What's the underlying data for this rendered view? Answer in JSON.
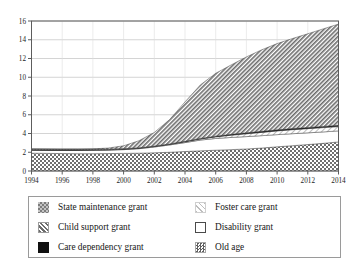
{
  "chart_data": {
    "type": "area",
    "title": "",
    "xlabel": "",
    "ylabel": "",
    "stacked": true,
    "grid": true,
    "legend_position": "bottom",
    "xlim": [
      1994,
      2014
    ],
    "ylim": [
      0,
      16
    ],
    "yticks": [
      0,
      2,
      4,
      6,
      8,
      10,
      12,
      14,
      16
    ],
    "xticks": [
      1994,
      1996,
      1998,
      2000,
      2002,
      2004,
      2006,
      2008,
      2010,
      2012,
      2014
    ],
    "ytick_labels": [
      "0",
      "2",
      "4",
      "6",
      "8",
      "10",
      "12",
      "14",
      "16"
    ],
    "xtick_labels": [
      "1994",
      "1996",
      "1998",
      "2000",
      "2002",
      "2004",
      "2006",
      "2008",
      "2010",
      "2012",
      "2014"
    ],
    "x": [
      1994,
      1995,
      1996,
      1997,
      1998,
      1999,
      2000,
      2001,
      2002,
      2003,
      2004,
      2005,
      2006,
      2007,
      2008,
      2009,
      2010,
      2011,
      2012,
      2013,
      2014
    ],
    "series": [
      {
        "name": "Old age",
        "pattern": "dense-checker",
        "order": 1,
        "values": [
          1.9,
          1.88,
          1.86,
          1.85,
          1.85,
          1.86,
          1.88,
          1.9,
          1.94,
          2.0,
          2.08,
          2.15,
          2.22,
          2.28,
          2.35,
          2.45,
          2.58,
          2.7,
          2.82,
          2.95,
          3.1
        ]
      },
      {
        "name": "Disability grant",
        "pattern": "white",
        "order": 2,
        "values": [
          0.31,
          0.32,
          0.33,
          0.34,
          0.35,
          0.37,
          0.4,
          0.48,
          0.62,
          0.78,
          0.95,
          1.15,
          1.25,
          1.3,
          1.32,
          1.32,
          1.3,
          1.28,
          1.25,
          1.22,
          1.18
        ]
      },
      {
        "name": "Foster care grant",
        "pattern": "light-hatch",
        "order": 3,
        "values": [
          0.02,
          0.02,
          0.02,
          0.02,
          0.03,
          0.03,
          0.03,
          0.04,
          0.05,
          0.06,
          0.08,
          0.11,
          0.17,
          0.24,
          0.3,
          0.35,
          0.4,
          0.43,
          0.45,
          0.46,
          0.46
        ]
      },
      {
        "name": "Care dependency grant",
        "pattern": "solid-black",
        "order": 4,
        "values": [
          0.02,
          0.02,
          0.02,
          0.02,
          0.02,
          0.02,
          0.03,
          0.03,
          0.04,
          0.05,
          0.06,
          0.07,
          0.08,
          0.09,
          0.1,
          0.11,
          0.11,
          0.12,
          0.12,
          0.13,
          0.13
        ]
      },
      {
        "name": "State maintenance grant",
        "pattern": "gray-checker",
        "order": 5,
        "values": [
          0.1,
          0.1,
          0.1,
          0.1,
          0.09,
          0.07,
          0.05,
          0.03,
          0.01,
          0.0,
          0.0,
          0.0,
          0.0,
          0.0,
          0.0,
          0.0,
          0.0,
          0.0,
          0.0,
          0.0,
          0.0
        ]
      },
      {
        "name": "Child support grant",
        "pattern": "diagonal-hatch",
        "order": 6,
        "values": [
          0.0,
          0.0,
          0.0,
          0.0,
          0.02,
          0.1,
          0.3,
          0.75,
          1.45,
          2.6,
          4.2,
          5.7,
          6.7,
          7.4,
          8.1,
          8.7,
          9.2,
          9.6,
          10.0,
          10.4,
          10.8
        ]
      }
    ],
    "totals": [
      2.35,
      2.34,
      2.33,
      2.33,
      2.36,
      2.45,
      2.69,
      3.23,
      4.11,
      5.49,
      7.37,
      9.18,
      10.42,
      11.31,
      12.17,
      12.93,
      13.59,
      14.13,
      14.64,
      15.16,
      15.67
    ]
  },
  "legend": {
    "items": [
      {
        "label": "State maintenance grant",
        "swatch": "gray-checker"
      },
      {
        "label": "Foster care grant",
        "swatch": "light-hatch"
      },
      {
        "label": "Child support grant",
        "swatch": "diagonal-hatch"
      },
      {
        "label": "Disability grant",
        "swatch": "white"
      },
      {
        "label": "Care dependency grant",
        "swatch": "solid-black"
      },
      {
        "label": "Old age",
        "swatch": "dense-checker"
      }
    ]
  },
  "colors": {
    "axis": "#5d5d5d",
    "grid": "#c9c9c9",
    "frame": "#5d5d5d",
    "text": "#1a1a1a",
    "legend_border": "#9a9a9a",
    "hatch_gray": "#6e6e6e",
    "checker_gray": "#8a8a8a",
    "black": "#101010",
    "white": "#ffffff",
    "light_hatch": "#b9b9b9"
  }
}
